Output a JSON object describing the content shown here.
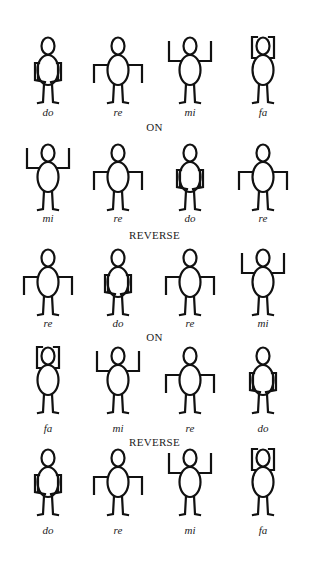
{
  "colors": {
    "ink": "#111111",
    "background": "#ffffff"
  },
  "rows": [
    {
      "figures": [
        {
          "pose": "do",
          "label": "do"
        },
        {
          "pose": "re",
          "label": "re"
        },
        {
          "pose": "mi",
          "label": "mi"
        },
        {
          "pose": "fa",
          "label": "fa"
        }
      ]
    },
    {
      "figures": [
        {
          "pose": "mi",
          "label": "mi"
        },
        {
          "pose": "re",
          "label": "re"
        },
        {
          "pose": "do",
          "label": "do"
        },
        {
          "pose": "re",
          "label": "re"
        }
      ]
    },
    {
      "figures": [
        {
          "pose": "re",
          "label": "re"
        },
        {
          "pose": "do",
          "label": "do"
        },
        {
          "pose": "re",
          "label": "re"
        },
        {
          "pose": "mi",
          "label": "mi"
        }
      ]
    },
    {
      "figures": [
        {
          "pose": "fa",
          "label": "fa"
        },
        {
          "pose": "mi",
          "label": "mi"
        },
        {
          "pose": "re",
          "label": "re"
        },
        {
          "pose": "do",
          "label": "do"
        }
      ]
    },
    {
      "figures": [
        {
          "pose": "do",
          "label": "do"
        },
        {
          "pose": "re",
          "label": "re"
        },
        {
          "pose": "mi",
          "label": "mi"
        },
        {
          "pose": "fa",
          "label": "fa"
        }
      ]
    }
  ],
  "separators": [
    "ON",
    "REVERSE",
    "ON",
    "REVERSE"
  ]
}
